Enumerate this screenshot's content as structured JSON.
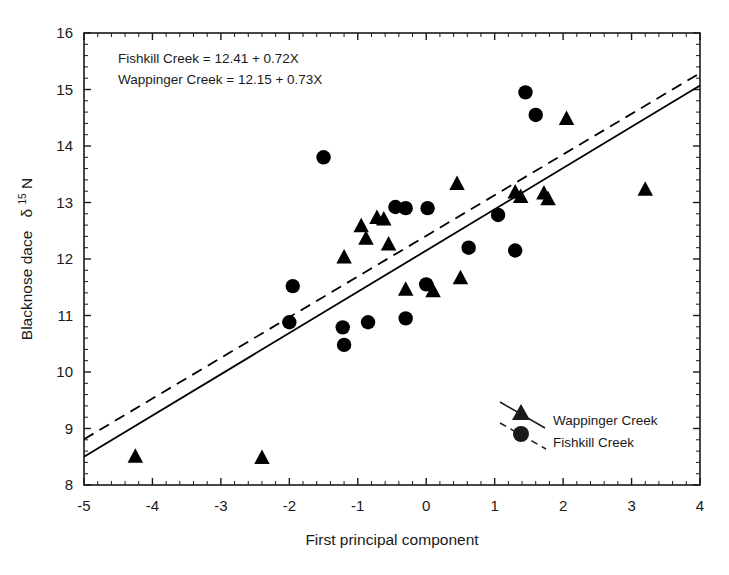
{
  "chart_data": {
    "type": "scatter",
    "title": "",
    "xlabel": "First principal component",
    "ylabel": "Blacknose dace δ15N",
    "ylabel_parts": {
      "main": "Blacknose dace",
      "delta": "δ",
      "superscript": "15",
      "element": "N"
    },
    "xlim": [
      -5,
      4
    ],
    "ylim": [
      8,
      16
    ],
    "xticks": [
      -5,
      -4,
      -3,
      -2,
      -1,
      0,
      1,
      2,
      3,
      4
    ],
    "xtick_labels": [
      "-5",
      "-4",
      "-3",
      "-2",
      "-1",
      "0",
      "1",
      "2",
      "3",
      "4"
    ],
    "yticks": [
      8,
      9,
      10,
      11,
      12,
      13,
      14,
      15,
      16
    ],
    "ytick_labels": [
      "8",
      "9",
      "10",
      "11",
      "12",
      "13",
      "14",
      "15",
      "16"
    ],
    "minor_ticks_per_interval": 5,
    "grid": false,
    "frame": true,
    "annotations": [
      "Fishkill Creek = 12.41 + 0.72X",
      "Wappinger Creek = 12.15 + 0.73X"
    ],
    "series": [
      {
        "name": "Wappinger Creek",
        "marker": "triangle",
        "color": "#000000",
        "line_style": "solid",
        "regression": {
          "intercept": 12.15,
          "slope": 0.73,
          "equation": "Wappinger Creek = 12.15 + 0.73X"
        },
        "points": [
          {
            "x": -4.25,
            "y": 8.52
          },
          {
            "x": -2.4,
            "y": 8.5
          },
          {
            "x": -1.2,
            "y": 12.05
          },
          {
            "x": -0.95,
            "y": 12.6
          },
          {
            "x": -0.88,
            "y": 12.38
          },
          {
            "x": -0.72,
            "y": 12.75
          },
          {
            "x": -0.62,
            "y": 12.72
          },
          {
            "x": -0.55,
            "y": 12.28
          },
          {
            "x": -0.3,
            "y": 11.48
          },
          {
            "x": 0.1,
            "y": 11.45
          },
          {
            "x": 0.45,
            "y": 13.35
          },
          {
            "x": 0.5,
            "y": 11.68
          },
          {
            "x": 1.3,
            "y": 13.2
          },
          {
            "x": 1.38,
            "y": 13.12
          },
          {
            "x": 1.72,
            "y": 13.18
          },
          {
            "x": 1.78,
            "y": 13.08
          },
          {
            "x": 2.05,
            "y": 14.5
          },
          {
            "x": 3.2,
            "y": 13.25
          }
        ]
      },
      {
        "name": "Fishkill Creek",
        "marker": "circle",
        "color": "#000000",
        "line_style": "dashed",
        "regression": {
          "intercept": 12.41,
          "slope": 0.72,
          "equation": "Fishkill Creek = 12.41 + 0.72X"
        },
        "points": [
          {
            "x": -2.0,
            "y": 10.88
          },
          {
            "x": -1.95,
            "y": 11.52
          },
          {
            "x": -1.5,
            "y": 13.8
          },
          {
            "x": -1.22,
            "y": 10.79
          },
          {
            "x": -1.2,
            "y": 10.48
          },
          {
            "x": -0.85,
            "y": 10.88
          },
          {
            "x": -0.45,
            "y": 12.92
          },
          {
            "x": -0.3,
            "y": 12.9
          },
          {
            "x": -0.3,
            "y": 10.95
          },
          {
            "x": 0.0,
            "y": 11.55
          },
          {
            "x": 0.02,
            "y": 12.9
          },
          {
            "x": 0.62,
            "y": 12.2
          },
          {
            "x": 1.05,
            "y": 12.78
          },
          {
            "x": 1.3,
            "y": 12.15
          },
          {
            "x": 1.45,
            "y": 14.95
          },
          {
            "x": 1.6,
            "y": 14.55
          }
        ]
      }
    ],
    "legend": {
      "position": "bottom-right",
      "entries": [
        {
          "label": "Wappinger Creek",
          "marker": "triangle",
          "line_style": "solid"
        },
        {
          "label": "Fishkill Creek",
          "marker": "circle",
          "line_style": "dashed"
        }
      ]
    }
  }
}
